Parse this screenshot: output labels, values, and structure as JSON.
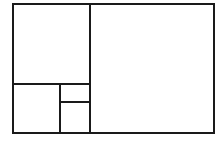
{
  "diagram": {
    "type": "golden-rectangle-subdivision",
    "stroke_color": "#1a1a1a",
    "background": "#ffffff",
    "outer_rect": {
      "x1": 13,
      "y1": 4,
      "x2": 214,
      "y2": 133
    },
    "regions": [
      {
        "name": "large-right-square",
        "x1": 90,
        "y1": 4,
        "x2": 214,
        "y2": 133
      },
      {
        "name": "top-left-square",
        "x1": 13,
        "y1": 4,
        "x2": 90,
        "y2": 84
      },
      {
        "name": "bottom-left-square",
        "x1": 13,
        "y1": 84,
        "x2": 60,
        "y2": 133
      },
      {
        "name": "small-upper-rect",
        "x1": 60,
        "y1": 84,
        "x2": 90,
        "y2": 102
      },
      {
        "name": "small-lower-square",
        "x1": 60,
        "y1": 102,
        "x2": 90,
        "y2": 133
      }
    ]
  }
}
